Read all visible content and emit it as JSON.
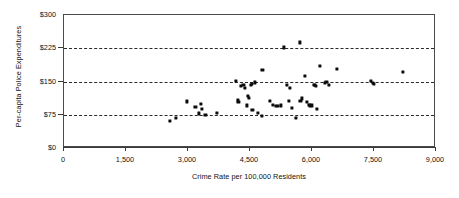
{
  "chart_data": {
    "type": "scatter",
    "title": "",
    "xlabel": "Crime Rate per 100,000 Residents",
    "ylabel": "Per-capita Police Expenditures",
    "xlim": [
      0,
      9000
    ],
    "ylim": [
      0,
      300
    ],
    "xticks": [
      0,
      1500,
      3000,
      4500,
      6000,
      7500,
      9000
    ],
    "xtick_labels": [
      "0",
      "1,500",
      "3,000",
      "4,500",
      "6,000",
      "7,500",
      "9,000"
    ],
    "yticks": [
      0,
      75,
      150,
      225,
      300
    ],
    "ytick_labels": [
      "$0",
      "$75",
      "$150",
      "$225",
      "$300"
    ],
    "grid": "horizontal-dashed",
    "gridlines_at": [
      75,
      150,
      225
    ],
    "legend": null,
    "marker_color": "#0b0b0b",
    "frame_color": "#4a4a4a",
    "points": [
      {
        "x": 2560,
        "y": 62
      },
      {
        "x": 2700,
        "y": 68
      },
      {
        "x": 2980,
        "y": 105
      },
      {
        "x": 3180,
        "y": 92
      },
      {
        "x": 3270,
        "y": 78
      },
      {
        "x": 3320,
        "y": 100
      },
      {
        "x": 3340,
        "y": 88
      },
      {
        "x": 3420,
        "y": 75
      },
      {
        "x": 3700,
        "y": 79
      },
      {
        "x": 4150,
        "y": 152
      },
      {
        "x": 4200,
        "y": 108
      },
      {
        "x": 4220,
        "y": 104
      },
      {
        "x": 4280,
        "y": 140
      },
      {
        "x": 4340,
        "y": 142
      },
      {
        "x": 4380,
        "y": 136
      },
      {
        "x": 4420,
        "y": 96
      },
      {
        "x": 4450,
        "y": 118
      },
      {
        "x": 4480,
        "y": 113
      },
      {
        "x": 4520,
        "y": 143
      },
      {
        "x": 4540,
        "y": 145
      },
      {
        "x": 4560,
        "y": 86
      },
      {
        "x": 4620,
        "y": 148
      },
      {
        "x": 4700,
        "y": 80
      },
      {
        "x": 4780,
        "y": 73
      },
      {
        "x": 4800,
        "y": 176
      },
      {
        "x": 4980,
        "y": 106
      },
      {
        "x": 5060,
        "y": 97
      },
      {
        "x": 5120,
        "y": 95
      },
      {
        "x": 5180,
        "y": 95
      },
      {
        "x": 5250,
        "y": 96
      },
      {
        "x": 5320,
        "y": 227
      },
      {
        "x": 5400,
        "y": 143
      },
      {
        "x": 5440,
        "y": 106
      },
      {
        "x": 5470,
        "y": 135
      },
      {
        "x": 5520,
        "y": 90
      },
      {
        "x": 5620,
        "y": 68
      },
      {
        "x": 5700,
        "y": 238
      },
      {
        "x": 5720,
        "y": 107
      },
      {
        "x": 5760,
        "y": 112
      },
      {
        "x": 5830,
        "y": 162
      },
      {
        "x": 5880,
        "y": 104
      },
      {
        "x": 5920,
        "y": 97
      },
      {
        "x": 5950,
        "y": 96
      },
      {
        "x": 6000,
        "y": 96
      },
      {
        "x": 6050,
        "y": 142
      },
      {
        "x": 6070,
        "y": 143
      },
      {
        "x": 6100,
        "y": 140
      },
      {
        "x": 6120,
        "y": 88
      },
      {
        "x": 6200,
        "y": 186
      },
      {
        "x": 6320,
        "y": 146
      },
      {
        "x": 6350,
        "y": 149
      },
      {
        "x": 6400,
        "y": 143
      },
      {
        "x": 6600,
        "y": 178
      },
      {
        "x": 7420,
        "y": 152
      },
      {
        "x": 7480,
        "y": 146
      },
      {
        "x": 7500,
        "y": 144
      },
      {
        "x": 8200,
        "y": 172
      }
    ]
  }
}
